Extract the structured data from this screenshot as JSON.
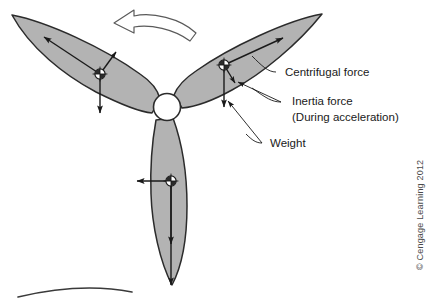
{
  "figure": {
    "background_color": "#ffffff",
    "blade_fill": "#b3b3b3",
    "blade_stroke": "#2b2b2b",
    "hub_fill": "#ffffff",
    "arrow_color": "#1a1a1a",
    "rotation_arrow": {
      "name": "rotation-direction-arrow",
      "direction": "counter-clockwise",
      "fill": "#ffffff",
      "stroke": "#555555"
    },
    "hub": {
      "cx": 167,
      "cy": 107,
      "r": 13
    },
    "blades": [
      {
        "id": "left-blade",
        "label": "Left blade",
        "tip_x": 12,
        "tip_y": 15,
        "cg_x": 100,
        "cg_y": 74
      },
      {
        "id": "right-blade",
        "label": "Right blade",
        "tip_x": 322,
        "tip_y": 14,
        "cg_x": 224,
        "cg_y": 65
      },
      {
        "id": "bottom-blade",
        "label": "Bottom blade",
        "tip_x": 172,
        "tip_y": 285,
        "cg_x": 171,
        "cg_y": 181
      }
    ],
    "vectors": [
      {
        "id": "centrifugal-left",
        "blade": "left-blade",
        "force": "Centrifugal force"
      },
      {
        "id": "inertia-left",
        "blade": "left-blade",
        "force": "Inertia force"
      },
      {
        "id": "weight-left",
        "blade": "left-blade",
        "force": "Weight"
      },
      {
        "id": "centrifugal-right",
        "blade": "right-blade",
        "force": "Centrifugal force"
      },
      {
        "id": "inertia-right",
        "blade": "right-blade",
        "force": "Inertia force"
      },
      {
        "id": "weight-right",
        "blade": "right-blade",
        "force": "Weight"
      },
      {
        "id": "inertia-bottom",
        "blade": "bottom-blade",
        "force": "Inertia force"
      },
      {
        "id": "weight-bottom",
        "blade": "bottom-blade",
        "force": "Weight"
      }
    ],
    "labels": {
      "centrifugal": "Centrifugal force",
      "inertia_line1": "Inertia force",
      "inertia_line2": "(During acceleration)",
      "weight": "Weight"
    },
    "credit": "© Cengage Learning 2012"
  }
}
